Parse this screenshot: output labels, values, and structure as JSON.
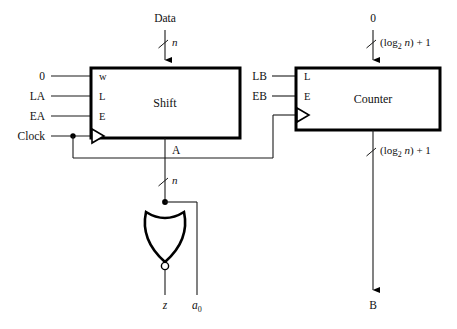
{
  "figure": {
    "background_color": "#ffffff",
    "line_color": "#1a1a1a"
  },
  "blocks": [
    {
      "id": "shift",
      "label": "Shift",
      "pins": [
        "w",
        "L",
        "E"
      ],
      "clock_pin": true
    },
    {
      "id": "counter",
      "label": "Counter",
      "pins": [
        "L",
        "E"
      ],
      "clock_pin": true
    }
  ],
  "labels": {
    "data_input": "Data",
    "zero_left": "0",
    "la": "LA",
    "ea": "EA",
    "clock": "Clock",
    "shift_pin_w": "w",
    "shift_pin_l": "L",
    "shift_pin_e": "E",
    "shift_name": "Shift",
    "shift_output": "A",
    "zero_right": "0",
    "lb": "LB",
    "eb": "EB",
    "counter_pin_l": "L",
    "counter_pin_e": "E",
    "counter_name": "Counter",
    "counter_output": "B",
    "gate_output": "z",
    "gate_second_input": "a",
    "gate_second_input_sub": "0"
  },
  "bus_widths": {
    "data_width": "n",
    "shift_output_width": "n",
    "counter_input_width_prefix": "(log",
    "counter_input_width_sub": "2",
    "counter_input_width_mid": "n",
    "counter_input_width_suffix": ") + 1",
    "counter_output_width_prefix": "(log",
    "counter_output_width_sub": "2",
    "counter_output_width_mid": "n",
    "counter_output_width_suffix": ") + 1"
  },
  "gate": {
    "type": "NOR",
    "inputs": 2,
    "inverting_bubble": true,
    "orientation": "down"
  }
}
